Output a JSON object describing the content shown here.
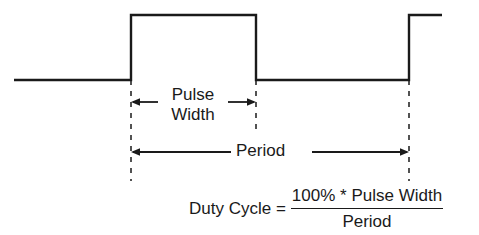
{
  "figure": {
    "type": "pulse-waveform-timing-diagram",
    "stroke_color": "#1a1a1a",
    "background_color": "#ffffff",
    "waveform": {
      "name": "square-pulse-train",
      "low_level_y": 80,
      "high_level_y": 15,
      "points": "14,80 131,80 131,15 256,15 256,80 409,80 409,15 442,15",
      "edges": {
        "first_rising_x": 131,
        "falling_x": 256,
        "second_rising_x": 409
      }
    },
    "dimension_pulse_width": {
      "label_line1": "Pulse",
      "label_line2": "Width",
      "arrow_y": 102,
      "left_x": 131,
      "right_x": 256
    },
    "dimension_period": {
      "label": "Period",
      "arrow_y": 152,
      "left_x": 131,
      "right_x": 409
    },
    "leader_lines": [
      {
        "name": "leader-pulse-start",
        "x": 131,
        "y1": 80,
        "y2": 181
      },
      {
        "name": "leader-pulse-end",
        "x": 256,
        "y1": 80,
        "y2": 129
      },
      {
        "name": "leader-period-end",
        "x": 409,
        "y1": 80,
        "y2": 181
      }
    ]
  },
  "formula": {
    "lhs": "Duty Cycle =",
    "numerator": "100% * Pulse Width",
    "denominator": "Period"
  }
}
